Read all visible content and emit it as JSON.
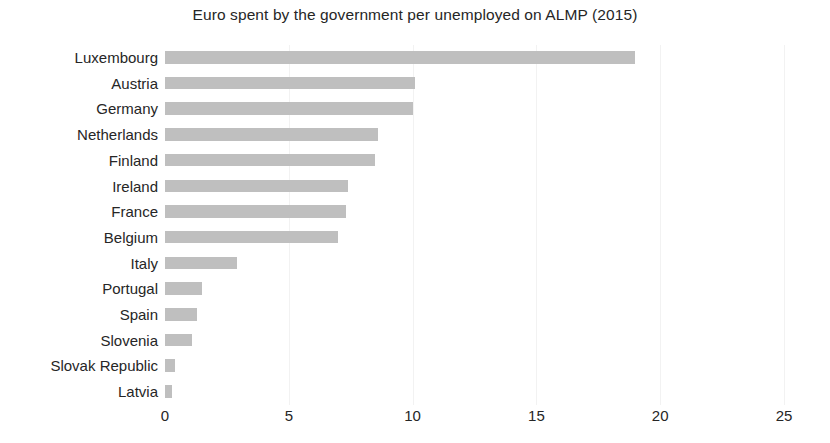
{
  "chart_data": {
    "type": "bar",
    "orientation": "horizontal",
    "title": "Euro spent by the government per unemployed on ALMP (2015)",
    "xlabel": "",
    "ylabel": "",
    "xlim": [
      0,
      25
    ],
    "xticks": [
      "0",
      "5",
      "10",
      "15",
      "20",
      "25"
    ],
    "grid": true,
    "legend": false,
    "bar_color": "#bfbfbf",
    "categories": [
      "Luxembourg",
      "Austria",
      "Germany",
      "Netherlands",
      "Finland",
      "Ireland",
      "France",
      "Belgium",
      "Italy",
      "Portugal",
      "Spain",
      "Slovenia",
      "Slovak Republic",
      "Latvia"
    ],
    "values": [
      19.0,
      10.1,
      10.0,
      8.6,
      8.5,
      7.4,
      7.3,
      7.0,
      2.9,
      1.5,
      1.3,
      1.1,
      0.4,
      0.3
    ]
  }
}
